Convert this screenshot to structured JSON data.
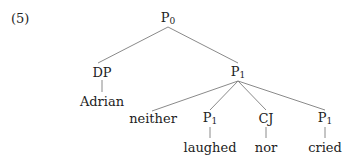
{
  "example_number": "(5)",
  "tree": {
    "root": {
      "label": "P",
      "sub": "0"
    },
    "dp": {
      "label": "DP",
      "word": "Adrian"
    },
    "p1": {
      "label": "P",
      "sub": "1"
    },
    "children": [
      {
        "label": "neither"
      },
      {
        "label": "P",
        "sub": "1",
        "word": "laughed"
      },
      {
        "label": "CJ",
        "word": "nor"
      },
      {
        "label": "P",
        "sub": "1",
        "word": "cried"
      }
    ]
  },
  "colors": {
    "line": "#8a8a8a",
    "text": "#222222"
  }
}
